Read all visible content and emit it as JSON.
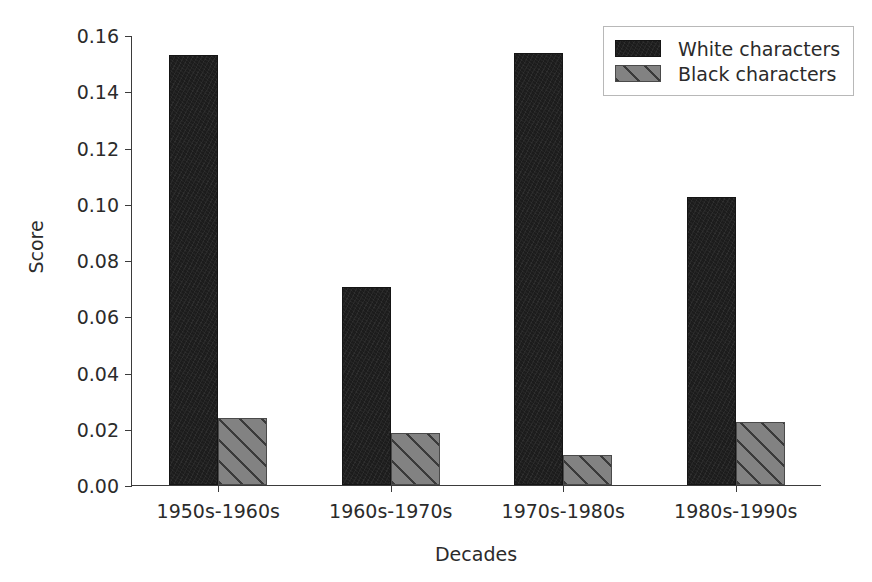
{
  "chart_data": {
    "type": "bar",
    "title": "",
    "xlabel": "Decades",
    "ylabel": "Score",
    "categories": [
      "1950s-1960s",
      "1960s-1970s",
      "1970s-1980s",
      "1980s-1990s"
    ],
    "series": [
      {
        "name": "White characters",
        "values": [
          0.1528,
          0.0705,
          0.1537,
          0.1025
        ],
        "color": "#1c1c1c",
        "hatch": "none"
      },
      {
        "name": "Black characters",
        "values": [
          0.0238,
          0.0185,
          0.0105,
          0.0225
        ],
        "color": "#828282",
        "hatch": "diagonal"
      }
    ],
    "ylim": [
      0.0,
      0.16
    ],
    "yticks": [
      "0.00",
      "0.02",
      "0.04",
      "0.06",
      "0.08",
      "0.10",
      "0.12",
      "0.14",
      "0.16"
    ],
    "ytick_values": [
      0.0,
      0.02,
      0.04,
      0.06,
      0.08,
      0.1,
      0.12,
      0.14,
      0.16
    ],
    "grid": false,
    "legend_position": "upper right",
    "legend_entries": [
      "White characters",
      "Black characters"
    ]
  },
  "axes": {
    "ylabel": "Score",
    "xlabel": "Decades"
  },
  "legend": {
    "entries": [
      {
        "label": "White characters"
      },
      {
        "label": "Black characters"
      }
    ]
  }
}
